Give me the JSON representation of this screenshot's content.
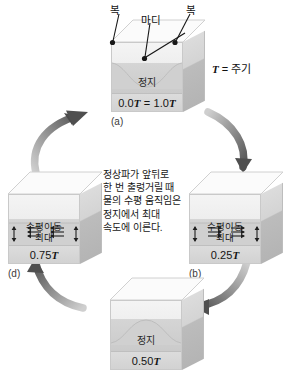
{
  "diagram": {
    "period_note": {
      "symbol": "T",
      "equals": "= 주기"
    },
    "callouts": {
      "antinode_left": "복",
      "antinode_right": "복",
      "node": "마디"
    },
    "center_paragraph": "정상파가 앞뒤로\n한 번 출렁거릴 때\n물의 수평 움직임은\n정지에서 최대\n속도에 이른다.",
    "stages": [
      {
        "id": "a",
        "label": "(a)",
        "state": "정지",
        "time_prefix": "0.0",
        "time_text": "0.0T = 1.0T",
        "time_a": "0.0",
        "time_b": "1.0",
        "symbol": "T",
        "surface": "saddle-high-edges",
        "motion": "none"
      },
      {
        "id": "b",
        "label": "(b)",
        "state": "수평이동\n최대",
        "state_line1": "수평이동",
        "state_line2": "최대",
        "time_text": "0.25T",
        "time_value": "0.25",
        "symbol": "T",
        "surface": "flat",
        "motion": "horizontal-right"
      },
      {
        "id": "c",
        "label": "(c)",
        "state": "정지",
        "time_text": "0.50T",
        "time_value": "0.50",
        "symbol": "T",
        "surface": "saddle-low-edges",
        "motion": "none"
      },
      {
        "id": "d",
        "label": "(d)",
        "state_line1": "수평이동",
        "state_line2": "최대",
        "time_text": "0.75T",
        "time_value": "0.75",
        "symbol": "T",
        "surface": "flat",
        "motion": "horizontal-left"
      }
    ],
    "cycle_arrows": [
      {
        "from": "d",
        "to": "a",
        "direction": "up-right"
      },
      {
        "from": "a",
        "to": "b",
        "direction": "down-right"
      },
      {
        "from": "b",
        "to": "c",
        "direction": "down-left"
      },
      {
        "from": "c",
        "to": "d",
        "direction": "up-left"
      }
    ],
    "colors": {
      "water": "#cccccc",
      "cube_front": "#ededed",
      "cube_side": "#c4c4c4",
      "cube_top": "#fafafa",
      "arrow": "#6f6f6f",
      "text": "#141414"
    }
  }
}
